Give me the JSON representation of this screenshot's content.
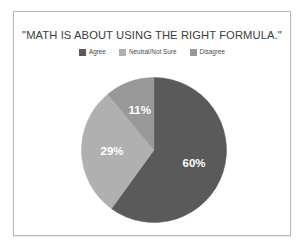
{
  "chart_data": {
    "type": "pie",
    "title": "\"MATH IS ABOUT USING THE RIGHT FORMULA.\"",
    "categories": [
      "Agree",
      "Neutral/Not Sure",
      "Disagree"
    ],
    "values": [
      60,
      29,
      11
    ],
    "value_labels": [
      "60%",
      "29%",
      "11%"
    ],
    "unit": "%",
    "colors": [
      "#5a5a5a",
      "#b0b0b0",
      "#989898"
    ],
    "legend_position": "top",
    "start_angle": 0,
    "direction": "clockwise",
    "grid": false,
    "xlabel": "",
    "ylabel": ""
  },
  "legend": {
    "items": [
      {
        "label": "Agree",
        "color": "#5a5a5a"
      },
      {
        "label": "Neutral/Not Sure",
        "color": "#b0b0b0"
      },
      {
        "label": "Disagree",
        "color": "#989898"
      }
    ]
  },
  "slices": [
    {
      "label": "60%",
      "name": "agree"
    },
    {
      "label": "29%",
      "name": "neutral"
    },
    {
      "label": "11%",
      "name": "disagree"
    }
  ]
}
